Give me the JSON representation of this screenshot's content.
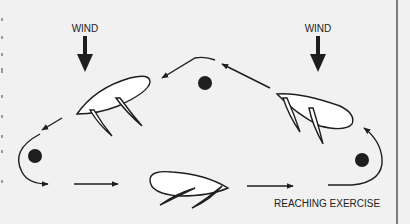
{
  "diagram": {
    "labels": {
      "wind_left": "WIND",
      "wind_right": "WIND",
      "caption": "REACHING EXERCISE"
    },
    "colors": {
      "background": "#f1f1f1",
      "ink": "#1e1e1e",
      "hull_fill": "#ffffff",
      "right_border": "#555555"
    },
    "elements": {
      "marks": [
        "top-mark",
        "left-mark",
        "right-mark"
      ],
      "boats": [
        "boat-upper-left",
        "boat-upper-right",
        "boat-bottom"
      ],
      "wind_arrows": [
        "wind-arrow-left",
        "wind-arrow-right"
      ]
    }
  }
}
